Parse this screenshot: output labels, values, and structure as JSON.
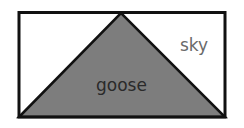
{
  "diagram": {
    "regions": [
      {
        "id": "goose",
        "label": "goose",
        "shape": "triangle",
        "fill": "#7d7d7d"
      },
      {
        "id": "sky",
        "label": "sky",
        "shape": "rectangle-remainder",
        "fill": "#ffffff"
      }
    ],
    "colors": {
      "border": "#111111",
      "goose_fill": "#7d7d7d",
      "sky_label": "#6a6a6a",
      "goose_label": "#2a2a2a"
    }
  }
}
